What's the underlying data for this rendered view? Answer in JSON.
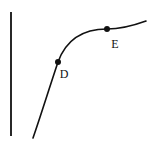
{
  "figure": {
    "type": "line-graph-diagram",
    "background_color": "#ffffff",
    "stroke_color": "#111111",
    "width": 149,
    "height": 146
  },
  "axis": {
    "name": "vertical-axis",
    "x": 11,
    "y_top": 12,
    "y_bottom": 136,
    "stroke_width": 1.8
  },
  "curve": {
    "name": "concave-increasing-curve",
    "description": "increasing concave-down curve rising steeply from lower-left then flattening toward upper-right",
    "path": "M 33 138 C 40 118, 48 92, 58 62 C 66 40, 82 29, 107 29 C 122 29, 135 25, 146 21",
    "stroke_width": 1.6
  },
  "points": [
    {
      "id": "D",
      "label": "D",
      "cx": 58,
      "cy": 62,
      "r": 3.0,
      "label_x": 64,
      "label_y": 78
    },
    {
      "id": "E",
      "label": "E",
      "cx": 107,
      "cy": 29,
      "r": 3.0,
      "label_x": 115,
      "label_y": 48
    }
  ],
  "chart_data": {
    "type": "line",
    "title": "",
    "xlabel": "",
    "ylabel": "",
    "grid": false,
    "legend": null,
    "series": [
      {
        "name": "curve",
        "description": "monotonically increasing, concave down",
        "x": [
          33,
          42,
          50,
          58,
          70,
          85,
          107,
          125,
          146
        ],
        "y": [
          138,
          115,
          88,
          62,
          44,
          34,
          29,
          26,
          21
        ]
      }
    ],
    "annotations": [
      {
        "text": "D",
        "x": 58,
        "y": 62
      },
      {
        "text": "E",
        "x": 107,
        "y": 29
      }
    ]
  }
}
